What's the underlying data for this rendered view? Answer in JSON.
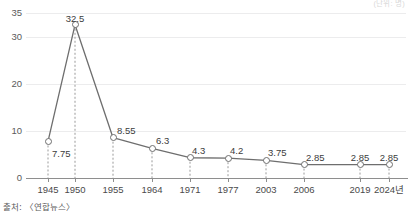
{
  "unit_note": "(단위: 명)",
  "source": "출처: 〈연합뉴스〉",
  "chart_data": {
    "type": "line",
    "title": "",
    "subtitle": "",
    "xlabel": "",
    "ylabel": "",
    "unit": "(단위: 명)",
    "grid": true,
    "legend": "none",
    "ylim": [
      0,
      35
    ],
    "yticks": [
      0,
      10,
      20,
      30,
      35
    ],
    "ytick_labels": [
      "0",
      "10",
      "20",
      "30",
      "35"
    ],
    "categories": [
      "1945",
      "1950",
      "1955",
      "1964",
      "1971",
      "1977",
      "2003",
      "2006",
      "2019",
      "2024년"
    ],
    "x_positions": [
      48,
      75,
      113,
      152,
      190,
      228,
      266,
      304,
      360,
      389
    ],
    "values": [
      7.75,
      32.5,
      8.55,
      6.3,
      4.3,
      4.2,
      3.75,
      2.85,
      2.85,
      2.85
    ],
    "value_labels": [
      "7.75",
      "32.5",
      "8.55",
      "6.3",
      "4.3",
      "4.2",
      "3.75",
      "2.85",
      "2.85",
      "2.85"
    ],
    "series": [
      {
        "name": "합계출산율",
        "values": [
          7.75,
          32.5,
          8.55,
          6.3,
          4.3,
          4.2,
          3.75,
          2.85,
          2.85,
          2.85
        ]
      }
    ],
    "marker": "open-circle",
    "line_color": "#6e6e6e",
    "marker_color": "#6e6e6e",
    "grid_color": "#ececed",
    "dropline_style": "dashed",
    "source": "출처: 〈연합뉴스〉"
  }
}
